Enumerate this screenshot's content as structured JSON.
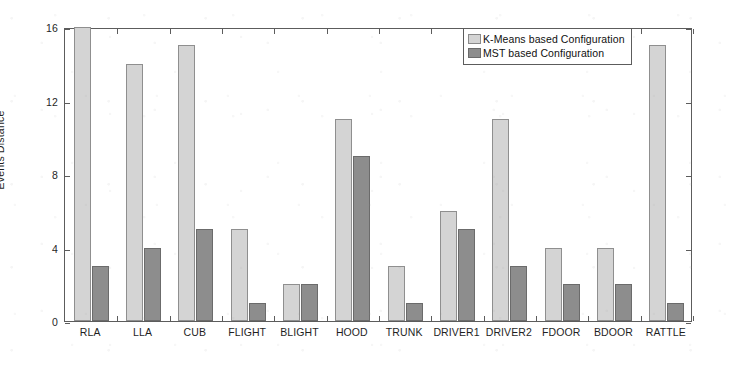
{
  "chart_data": {
    "type": "bar",
    "title": "",
    "xlabel": "",
    "ylabel": "Events Distance",
    "categories": [
      "RLA",
      "LLA",
      "CUB",
      "FLIGHT",
      "BLIGHT",
      "HOOD",
      "TRUNK",
      "DRIVER1",
      "DRIVER2",
      "FDOOR",
      "BDOOR",
      "RATTLE"
    ],
    "series": [
      {
        "name": "K-Means based Configuration",
        "color": "#d4d4d4",
        "values": [
          16,
          14,
          15,
          5,
          2,
          11,
          3,
          6,
          11,
          4,
          4,
          15
        ]
      },
      {
        "name": "MST based Configuration",
        "color": "#8d8d8d",
        "values": [
          3,
          4,
          5,
          1,
          2,
          9,
          1,
          5,
          3,
          2,
          2,
          1
        ]
      }
    ],
    "ylim": [
      0,
      16
    ],
    "yticks": [
      0,
      4,
      8,
      12,
      16
    ],
    "ytick_labels": [
      "0",
      "4",
      "8",
      "12",
      "16"
    ],
    "grid": false,
    "legend_position": "top-right",
    "axis_box": true
  },
  "legend": {
    "entries": [
      {
        "label": "K-Means based Configuration",
        "swatch": "#d4d4d4"
      },
      {
        "label": "MST based Configuration",
        "swatch": "#8d8d8d"
      }
    ]
  },
  "axes": {
    "y_label": "Events Distance",
    "y_ticks": [
      "0",
      "4",
      "8",
      "12",
      "16"
    ],
    "x_ticks": [
      "RLA",
      "LLA",
      "CUB",
      "FLIGHT",
      "BLIGHT",
      "HOOD",
      "TRUNK",
      "DRIVER1",
      "DRIVER2",
      "FDOOR",
      "BDOOR",
      "RATTLE"
    ]
  }
}
